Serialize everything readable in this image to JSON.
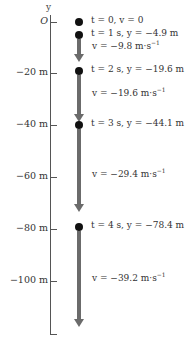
{
  "axis": {
    "label": "y",
    "ticks": [
      {
        "label": "O",
        "y": 22
      },
      {
        "label": "−20 m",
        "y": 73
      },
      {
        "label": "−40 m",
        "y": 125
      },
      {
        "label": "−60 m",
        "y": 177
      },
      {
        "label": "−80 m",
        "y": 229
      },
      {
        "label": "−100 m",
        "y": 281
      }
    ]
  },
  "positions": [
    {
      "label": "t = 0, v = 0",
      "dot_y": 22
    },
    {
      "label": "t = 1 s, y = −4.9 m",
      "dot_y": 35
    },
    {
      "label": "t = 2 s, y = −19.6 m",
      "dot_y": 71
    },
    {
      "label": "t = 3 s, y = −44.1 m",
      "dot_y": 125
    },
    {
      "label": "t = 4 s, y = −78.4 m",
      "dot_y": 227
    }
  ],
  "velocities": [
    {
      "label": "v = −9.8 m·s",
      "exp": "−1",
      "from": 39,
      "to": 62,
      "text_y": 45
    },
    {
      "label": "v = −19.6 m·s",
      "exp": "−1",
      "from": 75,
      "to": 122,
      "text_y": 92
    },
    {
      "label": "v = −29.4 m·s",
      "exp": "−1",
      "from": 129,
      "to": 212,
      "text_y": 173
    },
    {
      "label": "v = −39.2 m·s",
      "exp": "−1",
      "from": 231,
      "to": 327,
      "text_y": 277
    }
  ]
}
